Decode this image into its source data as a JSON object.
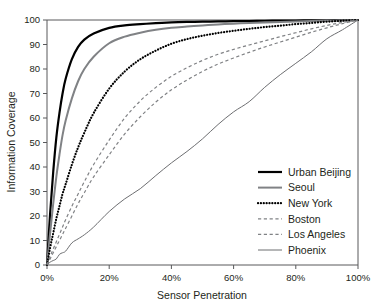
{
  "chart_data": {
    "type": "line",
    "title": "",
    "xlabel": "Sensor Penetration",
    "ylabel": "Information Coverage",
    "xlim": [
      0,
      100
    ],
    "ylim": [
      0,
      100
    ],
    "grid": false,
    "legend_position": "bottom-right",
    "xticks": [
      0,
      20,
      40,
      60,
      80,
      100
    ],
    "xtick_labels": [
      "0%",
      "20%",
      "40%",
      "60%",
      "80%",
      "100%"
    ],
    "yticks": [
      0,
      10,
      20,
      30,
      40,
      50,
      60,
      70,
      80,
      90,
      100
    ],
    "ytick_labels": [
      "0",
      "10",
      "20",
      "30",
      "40",
      "50",
      "60",
      "70",
      "80",
      "90",
      "100"
    ],
    "x": [
      0,
      1,
      2,
      3,
      4,
      5,
      6,
      8,
      10,
      12,
      15,
      20,
      25,
      30,
      35,
      40,
      45,
      50,
      55,
      60,
      65,
      70,
      75,
      80,
      85,
      90,
      95,
      100
    ],
    "series": [
      {
        "name": "Urban Beijing",
        "style": "solid",
        "color": "#000000",
        "width": 2.2,
        "values": [
          0,
          21,
          38,
          52,
          62,
          70,
          76,
          84,
          89,
          92,
          94.5,
          96.8,
          97.8,
          98.3,
          98.7,
          99.0,
          99.2,
          99.3,
          99.4,
          99.5,
          99.6,
          99.7,
          99.75,
          99.8,
          99.85,
          99.9,
          99.95,
          100
        ]
      },
      {
        "name": "Seoul",
        "style": "solid",
        "color": "#808285",
        "width": 2.0,
        "values": [
          0,
          13,
          25,
          36,
          45,
          53,
          59,
          68,
          75,
          80,
          85,
          90.5,
          93.2,
          94.8,
          96.0,
          96.8,
          97.3,
          97.8,
          98.2,
          98.5,
          98.8,
          99.0,
          99.2,
          99.4,
          99.6,
          99.75,
          99.9,
          100
        ]
      },
      {
        "name": "New York",
        "style": "dotted",
        "color": "#000000",
        "width": 2.2,
        "values": [
          0,
          7,
          13,
          19,
          24,
          29,
          33,
          41,
          48,
          54,
          62,
          72,
          79,
          84,
          87.5,
          90.3,
          92.2,
          93.6,
          94.7,
          95.6,
          96.4,
          97.1,
          97.7,
          98.3,
          98.8,
          99.3,
          99.7,
          100
        ]
      },
      {
        "name": "Boston",
        "style": "dashed",
        "color": "#808285",
        "width": 1.2,
        "values": [
          0,
          3.5,
          6.5,
          9.5,
          12.5,
          15.5,
          18.5,
          24,
          29,
          34,
          41,
          51,
          60,
          67,
          72.5,
          77,
          80.5,
          83.5,
          86,
          88,
          89.8,
          91.5,
          93.2,
          94.8,
          96.4,
          97.8,
          99.0,
          100
        ]
      },
      {
        "name": "Los Angeles",
        "style": "dashed",
        "color": "#808285",
        "width": 1.2,
        "values": [
          0,
          2.5,
          5,
          7.5,
          10,
          12.5,
          15,
          20,
          25,
          29.5,
          36,
          45,
          53.5,
          60.5,
          66.5,
          71.5,
          75.5,
          79,
          82,
          84.5,
          86.8,
          89,
          91,
          93,
          95,
          96.8,
          98.5,
          100
        ]
      },
      {
        "name": "Phoenix",
        "style": "solid",
        "color": "#6d6e71",
        "width": 1.0,
        "values": [
          0,
          1,
          2,
          3,
          4,
          5,
          6,
          8.5,
          10.5,
          12.5,
          16,
          21.5,
          27,
          31.5,
          36,
          41.5,
          46.5,
          52,
          57,
          62.5,
          67,
          72,
          77.5,
          82.5,
          87.5,
          92,
          96,
          100
        ]
      }
    ]
  },
  "legend": {
    "items": [
      {
        "label": "Urban Beijing"
      },
      {
        "label": "Seoul"
      },
      {
        "label": "New York"
      },
      {
        "label": "Boston"
      },
      {
        "label": "Los Angeles"
      },
      {
        "label": "Phoenix"
      }
    ]
  }
}
